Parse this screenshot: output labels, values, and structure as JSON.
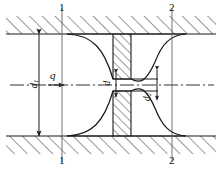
{
  "figure": {
    "kind": "orifice-plate-flow-diagram",
    "stroke_color": "#1a1a1a",
    "hatch_color": "#1a1a1a",
    "background": "#ffffff"
  },
  "labels": {
    "pipe_diameter": "d",
    "pipe_diameter_sub": "1",
    "orifice_diameter": "d",
    "orifice_diameter_sub": "",
    "contracted_diameter": "d",
    "contracted_diameter_sub": "2",
    "flow_rate": "q"
  },
  "sections": {
    "left_top": "1",
    "left_bottom": "1",
    "right_top": "2",
    "right_bottom": "2"
  },
  "icons": {
    "flow_arrow": "flow-arrow-icon",
    "dimension_arrow": "dimension-arrow-icon",
    "centerline": "centerline-icon",
    "hatching": "hatching-icon"
  },
  "geometry": {
    "pipe_top_y": 34,
    "pipe_bottom_y": 136,
    "centerline_y": 85,
    "plate_left_x": 113,
    "plate_right_x": 131,
    "section1_x": 62,
    "section2_x": 172
  }
}
